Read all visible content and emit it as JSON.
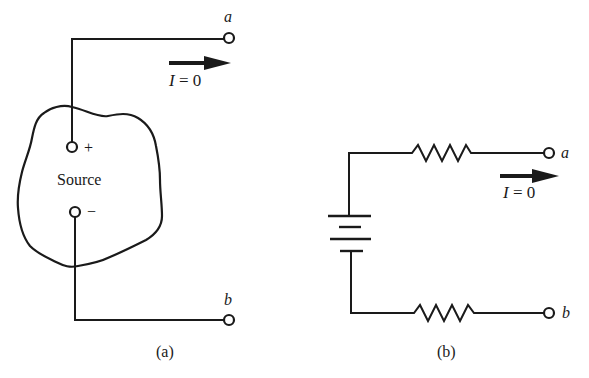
{
  "figure_a": {
    "caption": "(a)",
    "source_label": "Source",
    "plus_sign": "+",
    "minus_sign": "−",
    "terminal_a": "a",
    "terminal_b": "b",
    "current_var": "I",
    "current_eq": " = 0"
  },
  "figure_b": {
    "caption": "(b)",
    "terminal_a": "a",
    "terminal_b": "b",
    "current_var": "I",
    "current_eq": " = 0",
    "components": [
      "battery",
      "resistor-top",
      "resistor-bottom"
    ]
  }
}
